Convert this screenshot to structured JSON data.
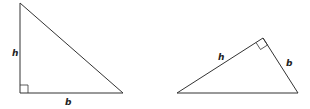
{
  "diagram": {
    "triangles": [
      {
        "name": "left-triangle",
        "height_label": "h",
        "base_label": "b"
      },
      {
        "name": "right-triangle",
        "height_label": "h",
        "base_label": "b"
      }
    ],
    "stroke_color": "#333333"
  }
}
